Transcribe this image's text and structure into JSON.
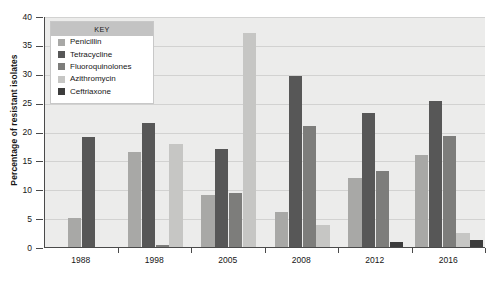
{
  "chart_data": {
    "type": "bar",
    "title": "",
    "subtitle": "",
    "xlabel": "",
    "ylabel": "Percentage of resistant isolates",
    "categories": [
      "1988",
      "1998",
      "2005",
      "2008",
      "2012",
      "2016"
    ],
    "ylim": [
      0,
      40
    ],
    "ytick_values": [
      0,
      5,
      10,
      15,
      20,
      25,
      30,
      35,
      40
    ],
    "ytick_labels": [
      "0",
      "5",
      "10",
      "15",
      "20",
      "25",
      "30",
      "35",
      "40"
    ],
    "grid": "horizontal",
    "legend_position": "top-left-inside",
    "legend_title": "KEY",
    "series": [
      {
        "name": "Penicillin",
        "color": "#a8a8a6",
        "values": [
          5.0,
          16.5,
          9.0,
          6.0,
          11.9,
          16.0
        ]
      },
      {
        "name": "Tetracycline",
        "color": "#575757",
        "values": [
          19.0,
          21.5,
          17.0,
          29.6,
          23.2,
          25.3
        ]
      },
      {
        "name": "Fluoroquinolones",
        "color": "#7d7d7b",
        "values": [
          0,
          0.3,
          9.4,
          21.0,
          13.2,
          19.2
        ]
      },
      {
        "name": "Azithromycin",
        "color": "#c6c6c4",
        "values": [
          0,
          17.9,
          37.0,
          3.8,
          0,
          2.4
        ]
      },
      {
        "name": "Ceftriaxone",
        "color": "#3c3c3c",
        "values": [
          0,
          0,
          0,
          0,
          0.9,
          1.3
        ]
      }
    ]
  },
  "axes": {
    "background_color": "#ececeb",
    "gridline_color": "#d2d2d1",
    "axis_line_color": "#4a4a4a"
  }
}
